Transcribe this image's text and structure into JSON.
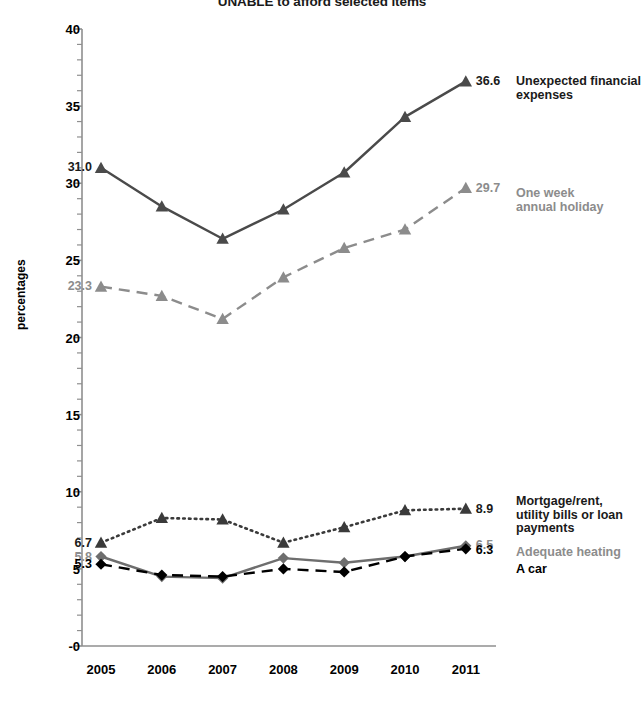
{
  "chart_data": {
    "type": "line",
    "title": "UNABLE to afford selected items",
    "xlabel": "",
    "ylabel": "percentages",
    "categories": [
      "2005",
      "2006",
      "2007",
      "2008",
      "2009",
      "2010",
      "2011"
    ],
    "x": [
      2005,
      2006,
      2007,
      2008,
      2009,
      2010,
      2011
    ],
    "ylim": [
      0,
      40
    ],
    "yticks": [
      "-0",
      "5",
      "10",
      "15",
      "20",
      "25",
      "30",
      "35",
      "40"
    ],
    "ytick_values": [
      0,
      5,
      10,
      15,
      20,
      25,
      30,
      35,
      40
    ],
    "minor_tick_interval": 1,
    "grid": false,
    "legend_position": "right",
    "series": [
      {
        "name": "Unexpected financial expenses",
        "values": [
          31.0,
          28.5,
          26.4,
          28.3,
          30.7,
          34.3,
          36.6
        ],
        "color": "#4a4a4a",
        "marker": "triangle",
        "linestyle": "solid",
        "start_label": "31.0",
        "end_label": "36.6",
        "label_color": "#1a1a1a"
      },
      {
        "name": "One week\nannual holiday",
        "values": [
          23.3,
          22.7,
          21.2,
          23.9,
          25.8,
          27.0,
          29.7
        ],
        "color": "#8c8c8c",
        "marker": "triangle",
        "linestyle": "dashed",
        "start_label": "23.3",
        "end_label": "29.7",
        "label_color": "#8c8c8c"
      },
      {
        "name": "Mortgage/rent,\nutility bills or loan\npayments",
        "values": [
          6.7,
          8.3,
          8.2,
          6.7,
          7.7,
          8.8,
          8.9
        ],
        "color": "#3a3a3a",
        "marker": "triangle",
        "linestyle": "dotted",
        "start_label": "6.7",
        "end_label": "8.9",
        "label_color": "#1a1a1a"
      },
      {
        "name": "Adequate heating",
        "values": [
          5.8,
          4.5,
          4.4,
          5.7,
          5.4,
          5.8,
          6.5
        ],
        "color": "#6e6e6e",
        "marker": "diamond",
        "linestyle": "solid",
        "start_label": "5.8",
        "end_label": "6.5",
        "label_color": "#8c8c8c"
      },
      {
        "name": "A car",
        "values": [
          5.3,
          4.6,
          4.5,
          5.0,
          4.8,
          5.8,
          6.3
        ],
        "color": "#000000",
        "marker": "diamond",
        "linestyle": "dashed",
        "start_label": "5.3",
        "end_label": "6.3",
        "label_color": "#000000"
      }
    ]
  },
  "axis": {
    "line_color": "#8f8f8f"
  }
}
